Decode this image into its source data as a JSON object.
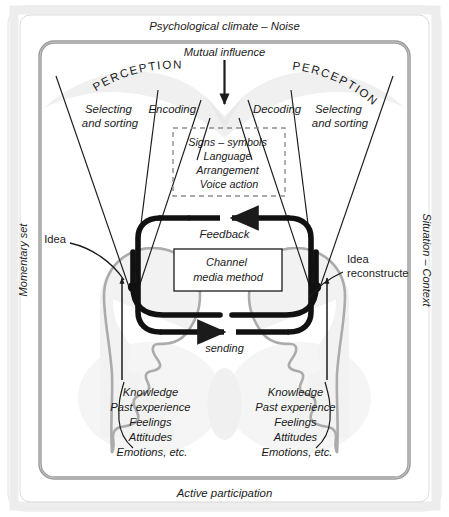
{
  "diagram": {
    "title_outer_top": "Psychological climate – Noise",
    "title_outer_bottom": "Active participation",
    "side_left": "Momentary set",
    "side_right": "Situation – Context",
    "mutual_influence": "Mutual influence",
    "perception_left": "PERCEPTION",
    "perception_right": "PERCEPTION",
    "selecting_left_line1": "Selecting",
    "selecting_left_line2": "and sorting",
    "selecting_right_line1": "Selecting",
    "selecting_right_line2": "and sorting",
    "encoding": "Encoding",
    "decoding": "Decoding",
    "signs_box": {
      "line1": "Signs – symbols",
      "line2": "Language",
      "line3": "Arrangement",
      "line4": "Voice action"
    },
    "feedback": "Feedback",
    "sending": "sending",
    "channel_box": {
      "line1": "Channel",
      "line2": "media method"
    },
    "idea_left": "Idea",
    "idea_right_line1": "Idea",
    "idea_right_line2": "reconstructed",
    "attributes_left": [
      "Knowledge",
      "Past experience",
      "Feelings",
      "Attitudes",
      "Emotions, etc."
    ],
    "attributes_right": [
      "Knowledge",
      "Past experience",
      "Feelings",
      "Attitudes",
      "Emotions, etc."
    ]
  },
  "colors": {
    "ink": "#1b1b1b",
    "frame_outer": "#e3e3e3",
    "frame_inner": "#9a9a9a",
    "head_outline": "#a8a8a8",
    "head_fill": "#f0f0f0",
    "cloud": "#e6e6e6",
    "dashed": "#8d8d8d",
    "paper": "#ffffff"
  }
}
